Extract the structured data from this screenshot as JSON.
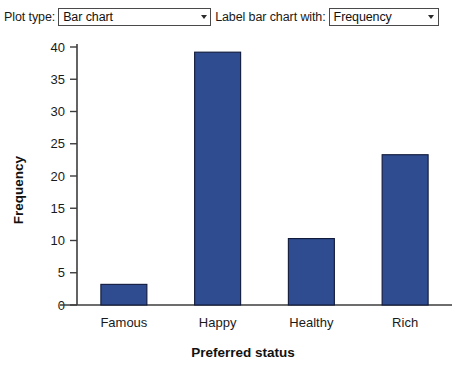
{
  "toolbar": {
    "plot_type_label": "Plot type:",
    "plot_type_value": "Bar chart",
    "label_with_label": "Label bar chart with:",
    "label_with_value": "Frequency",
    "caret_icon": "chevron-down-icon"
  },
  "chart_data": {
    "type": "bar",
    "title": "",
    "categories": [
      "Famous",
      "Happy",
      "Healthy",
      "Rich"
    ],
    "values": [
      3.2,
      39.2,
      10.3,
      23.3
    ],
    "xlabel": "Preferred status",
    "ylabel": "Frequency",
    "ylim": [
      0,
      40
    ],
    "yticks": [
      0,
      5,
      10,
      15,
      20,
      25,
      30,
      35,
      40
    ],
    "ytick_labels": [
      "0",
      "5",
      "10",
      "15",
      "20",
      "25",
      "30",
      "35",
      "40"
    ],
    "grid": false,
    "legend": false,
    "bar_color": "#2e4c8f",
    "bar_edge_color": "#10193a"
  }
}
